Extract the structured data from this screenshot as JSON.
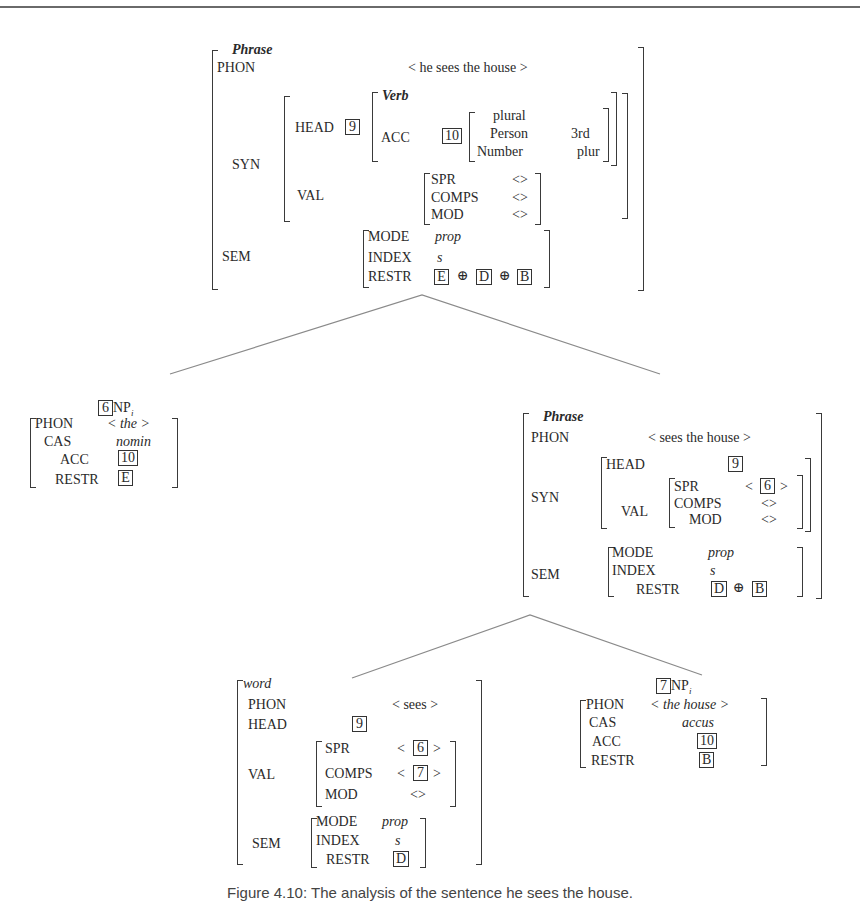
{
  "figure": {
    "caption": "Figure 4.10: The analysis of the sentence he sees the house.",
    "root": {
      "type": "Phrase",
      "phon_label": "PHON",
      "phon": "< he sees the house >",
      "syn_label": "SYN",
      "head_label": "HEAD",
      "head_tag": "9",
      "head_type": "Verb",
      "acc_label": "ACC",
      "acc_tag": "10",
      "acc_inner": {
        "val": "plural",
        "person_label": "Person",
        "person": "3rd",
        "number_label": "Number",
        "number": "plur"
      },
      "val_label": "VAL",
      "spr_label": "SPR",
      "spr": "<>",
      "comps_label": "COMPS",
      "comps": "<>",
      "mod_label": "MOD",
      "mod": "<>",
      "sem_label": "SEM",
      "mode_label": "MODE",
      "mode": "prop",
      "index_label": "INDEX",
      "index": "s",
      "restr_label": "RESTR",
      "restr_tags": [
        "E",
        "D",
        "B"
      ],
      "oplus": "⊕"
    },
    "np_subject": {
      "tag": "6",
      "category": "NP",
      "subscript": "i",
      "phon_label": "PHON",
      "phon": "< the >",
      "cas_label": "CAS",
      "cas": "nomin",
      "acc_label": "ACC",
      "acc_tag": "10",
      "restr_label": "RESTR",
      "restr_tag": "E"
    },
    "vp": {
      "type": "Phrase",
      "phon_label": "PHON",
      "phon": "< sees the house >",
      "syn_label": "SYN",
      "head_label": "HEAD",
      "head_tag": "9",
      "val_label": "VAL",
      "spr_label": "SPR",
      "spr_open": "<",
      "spr_tag": "6",
      "spr_close": ">",
      "comps_label": "COMPS",
      "comps": "<>",
      "mod_label": "MOD",
      "mod": "<>",
      "sem_label": "SEM",
      "mode_label": "MODE",
      "mode": "prop",
      "index_label": "INDEX",
      "index": "s",
      "restr_label": "RESTR",
      "restr_tags": [
        "D",
        "B"
      ],
      "oplus": "⊕"
    },
    "verb": {
      "type": "word",
      "phon_label": "PHON",
      "phon": "< sees >",
      "head_label": "HEAD",
      "head_tag": "9",
      "val_label": "VAL",
      "spr_label": "SPR",
      "spr_open": "<",
      "spr_tag": "6",
      "spr_close": ">",
      "comps_label": "COMPS",
      "comps_open": "<",
      "comps_tag": "7",
      "comps_close": ">",
      "mod_label": "MOD",
      "mod": "<>",
      "sem_label": "SEM",
      "mode_label": "MODE",
      "mode": "prop",
      "index_label": "INDEX",
      "index": "s",
      "restr_label": "RESTR",
      "restr_tag": "D"
    },
    "np_object": {
      "tag": "7",
      "category": "NP",
      "subscript": "i",
      "phon_label": "PHON",
      "phon": "< the house >",
      "cas_label": "CAS",
      "cas": "accus",
      "acc_label": "ACC",
      "acc_tag": "10",
      "restr_label": "RESTR",
      "restr_tag": "B"
    }
  },
  "colors": {
    "text": "#2a2a2a",
    "bracket": "#3a3a3a",
    "tree_line": "#8a8a8a",
    "frame_line": "#6a6a6a"
  }
}
